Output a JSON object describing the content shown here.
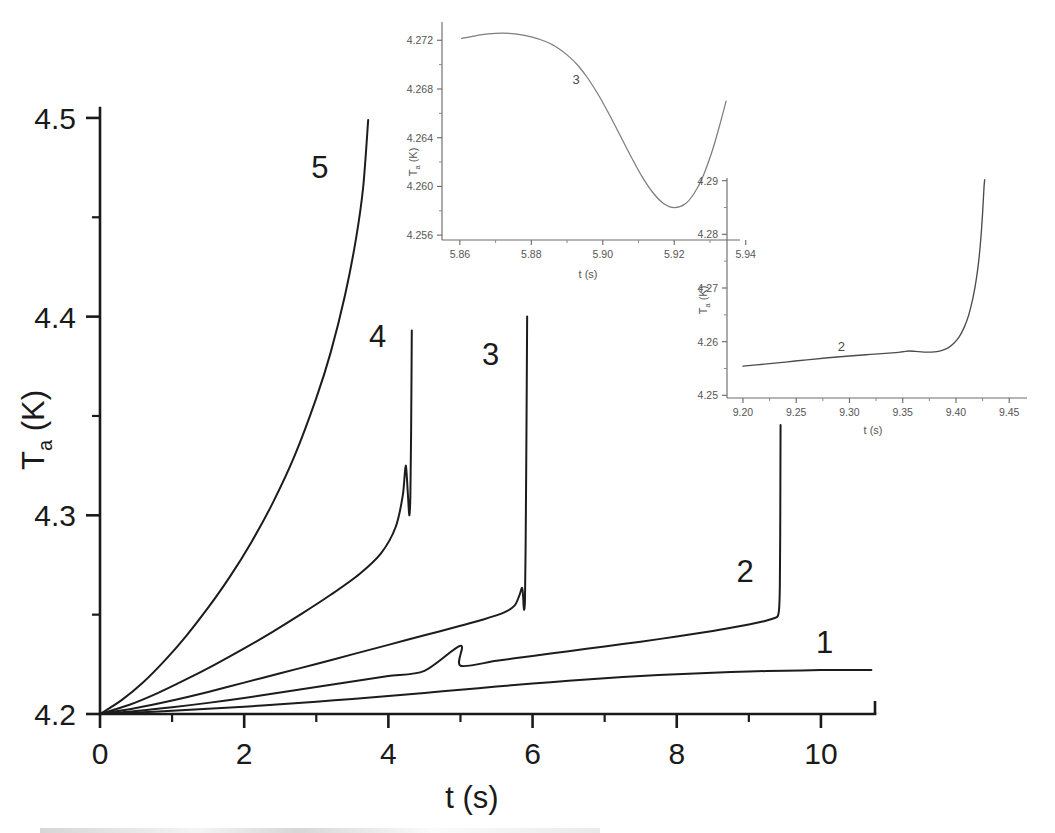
{
  "figure": {
    "background_color": "#ffffff",
    "line_color": "#1c1c1c",
    "inset_line_color": "#7d7d7d"
  },
  "chart_data": [
    {
      "id": "main-plot",
      "type": "line",
      "title": "",
      "xlabel": "t (s)",
      "ylabel": "T  (K)",
      "ylabel_base": "T",
      "ylabel_sub": "a",
      "ylabel_unit": "(K)",
      "xlim": [
        0,
        10.75
      ],
      "ylim": [
        4.2,
        4.505
      ],
      "xticks": [
        0,
        2,
        4,
        6,
        8,
        10
      ],
      "xticklabels": [
        "0",
        "2",
        "4",
        "6",
        "8",
        "10"
      ],
      "xminorticks": [
        1,
        3,
        5,
        7,
        9
      ],
      "yticks": [
        4.2,
        4.3,
        4.4,
        4.5
      ],
      "yticklabels": [
        "4.2",
        "4.3",
        "4.4",
        "4.5"
      ],
      "yminorticks": [
        4.25,
        4.35,
        4.45
      ],
      "grid": false,
      "legend_position": "inline-curve-labels",
      "series": [
        {
          "name": "1",
          "label": "1",
          "label_x": 10.05,
          "label_y": 4.2305,
          "points": [
            [
              0.0,
              4.2
            ],
            [
              0.5,
              4.2007
            ],
            [
              1.0,
              4.2016
            ],
            [
              1.5,
              4.2026
            ],
            [
              2.0,
              4.2037
            ],
            [
              2.5,
              4.2049
            ],
            [
              3.0,
              4.2062
            ],
            [
              3.5,
              4.2076
            ],
            [
              4.0,
              4.2091
            ],
            [
              4.5,
              4.2106
            ],
            [
              5.0,
              4.2122
            ],
            [
              5.5,
              4.2138
            ],
            [
              6.0,
              4.2153
            ],
            [
              6.5,
              4.2167
            ],
            [
              7.0,
              4.218
            ],
            [
              7.5,
              4.2191
            ],
            [
              8.0,
              4.22
            ],
            [
              8.5,
              4.2208
            ],
            [
              9.0,
              4.2214
            ],
            [
              9.5,
              4.2218
            ],
            [
              10.0,
              4.2221
            ],
            [
              10.4,
              4.2222
            ],
            [
              10.7,
              4.2222
            ]
          ]
        },
        {
          "name": "2",
          "label": "2",
          "label_x": 8.95,
          "label_y": 4.2665,
          "points": [
            [
              0.0,
              4.2
            ],
            [
              0.5,
              4.2015
            ],
            [
              1.0,
              4.2034
            ],
            [
              1.5,
              4.2056
            ],
            [
              2.0,
              4.2081
            ],
            [
              2.5,
              4.2108
            ],
            [
              3.0,
              4.2136
            ],
            [
              3.5,
              4.2164
            ],
            [
              4.0,
              4.2191
            ],
            [
              4.5,
              4.2217
            ],
            [
              5.0,
              4.2343
            ],
            [
              5.0,
              4.2243
            ],
            [
              5.5,
              4.2268
            ],
            [
              6.0,
              4.2292
            ],
            [
              6.5,
              4.2316
            ],
            [
              7.0,
              4.234
            ],
            [
              7.5,
              4.2364
            ],
            [
              8.0,
              4.239
            ],
            [
              8.5,
              4.2418
            ],
            [
              9.0,
              4.245
            ],
            [
              9.2,
              4.2466
            ],
            [
              9.35,
              4.2482
            ],
            [
              9.4,
              4.2492
            ],
            [
              9.42,
              4.253
            ],
            [
              9.43,
              4.264
            ],
            [
              9.435,
              4.29
            ],
            [
              9.44,
              4.3455
            ]
          ],
          "spike": {
            "t": 9.43,
            "peak": 4.3455
          }
        },
        {
          "name": "3",
          "label": "3",
          "label_x": 5.42,
          "label_y": 4.3755,
          "points": [
            [
              0.0,
              4.2
            ],
            [
              0.5,
              4.203
            ],
            [
              1.0,
              4.2068
            ],
            [
              1.5,
              4.2111
            ],
            [
              2.0,
              4.2158
            ],
            [
              2.5,
              4.2205
            ],
            [
              3.0,
              4.2252
            ],
            [
              3.5,
              4.23
            ],
            [
              4.0,
              4.2348
            ],
            [
              4.5,
              4.2396
            ],
            [
              5.0,
              4.2444
            ],
            [
              5.3,
              4.2474
            ],
            [
              5.6,
              4.251
            ],
            [
              5.75,
              4.2545
            ],
            [
              5.82,
              4.26
            ],
            [
              5.855,
              4.2635
            ],
            [
              5.87,
              4.2585
            ],
            [
              5.88,
              4.2525
            ],
            [
              5.895,
              4.258
            ],
            [
              5.905,
              4.29
            ],
            [
              5.915,
              4.34
            ],
            [
              5.925,
              4.4
            ]
          ],
          "spike": {
            "t": 5.92,
            "peak": 4.4
          }
        },
        {
          "name": "4",
          "label": "4",
          "label_x": 3.85,
          "label_y": 4.3845,
          "points": [
            [
              0.0,
              4.2
            ],
            [
              0.4,
              4.2045
            ],
            [
              0.8,
              4.2105
            ],
            [
              1.2,
              4.2175
            ],
            [
              1.6,
              4.225
            ],
            [
              2.0,
              4.233
            ],
            [
              2.4,
              4.2415
            ],
            [
              2.8,
              4.2505
            ],
            [
              3.2,
              4.26
            ],
            [
              3.6,
              4.2705
            ],
            [
              3.9,
              4.281
            ],
            [
              4.1,
              4.294
            ],
            [
              4.2,
              4.31
            ],
            [
              4.24,
              4.325
            ],
            [
              4.27,
              4.311
            ],
            [
              4.29,
              4.3
            ],
            [
              4.305,
              4.3095
            ],
            [
              4.315,
              4.34
            ],
            [
              4.325,
              4.393
            ]
          ],
          "spike": {
            "t": 4.3,
            "peak": 4.393
          }
        },
        {
          "name": "5",
          "label": "5",
          "label_x": 3.05,
          "label_y": 4.47,
          "points": [
            [
              0.0,
              4.2
            ],
            [
              0.3,
              4.207
            ],
            [
              0.6,
              4.216
            ],
            [
              0.9,
              4.227
            ],
            [
              1.2,
              4.2395
            ],
            [
              1.5,
              4.2535
            ],
            [
              1.8,
              4.269
            ],
            [
              2.1,
              4.2865
            ],
            [
              2.4,
              4.3065
            ],
            [
              2.7,
              4.33
            ],
            [
              3.0,
              4.359
            ],
            [
              3.2,
              4.382
            ],
            [
              3.4,
              4.411
            ],
            [
              3.55,
              4.439
            ],
            [
              3.65,
              4.465
            ],
            [
              3.72,
              4.499
            ]
          ]
        }
      ]
    },
    {
      "id": "inset-1",
      "type": "line",
      "title": "",
      "xlabel": "t (s)",
      "ylabel": "T  (K)",
      "ylabel_base": "T",
      "ylabel_sub": "a",
      "ylabel_unit": "(K)",
      "xlim": [
        5.855,
        5.937
      ],
      "ylim": [
        4.2556,
        4.2735
      ],
      "xticks": [
        5.86,
        5.88,
        5.9,
        5.92,
        5.94
      ],
      "xticklabels": [
        "5.86",
        "5.88",
        "5.90",
        "5.92",
        "5.94"
      ],
      "xminorticks": [
        5.87,
        5.89,
        5.91,
        5.93
      ],
      "yticks": [
        4.256,
        4.26,
        4.264,
        4.268,
        4.272
      ],
      "yticklabels": [
        "4.256",
        "4.260",
        "4.264",
        "4.268",
        "4.272"
      ],
      "yminorticks": [
        4.258,
        4.262,
        4.266,
        4.27
      ],
      "grid": false,
      "series": [
        {
          "name": "3",
          "label": "3",
          "label_x": 5.8925,
          "label_y": 4.2684,
          "points": [
            [
              5.8605,
              4.27215
            ],
            [
              5.864,
              4.27235
            ],
            [
              5.868,
              4.27252
            ],
            [
              5.872,
              4.27258
            ],
            [
              5.876,
              4.2725
            ],
            [
              5.88,
              4.27228
            ],
            [
              5.884,
              4.2719
            ],
            [
              5.887,
              4.27145
            ],
            [
              5.89,
              4.2708
            ],
            [
              5.893,
              4.26995
            ],
            [
              5.896,
              4.2688
            ],
            [
              5.899,
              4.2674
            ],
            [
              5.902,
              4.2658
            ],
            [
              5.905,
              4.2641
            ],
            [
              5.908,
              4.2624
            ],
            [
              5.911,
              4.2608
            ],
            [
              5.914,
              4.2595
            ],
            [
              5.917,
              4.2586
            ],
            [
              5.92,
              4.25825
            ],
            [
              5.923,
              4.25855
            ],
            [
              5.9255,
              4.2594
            ],
            [
              5.928,
              4.2608
            ],
            [
              5.9305,
              4.2628
            ],
            [
              5.9325,
              4.2648
            ],
            [
              5.9345,
              4.267
            ]
          ]
        }
      ]
    },
    {
      "id": "inset-2",
      "type": "line",
      "title": "",
      "xlabel": "t (s)",
      "ylabel": "T  (K)",
      "ylabel_base": "T",
      "ylabel_sub": "a",
      "ylabel_unit": "(K)",
      "xlim": [
        9.185,
        9.462
      ],
      "ylim": [
        4.2495,
        4.2905
      ],
      "xticks": [
        9.2,
        9.25,
        9.3,
        9.35,
        9.4,
        9.45
      ],
      "xticklabels": [
        "9.20",
        "9.25",
        "9.30",
        "9.35",
        "9.40",
        "9.45"
      ],
      "xminorticks": [
        9.225,
        9.275,
        9.325,
        9.375,
        9.425
      ],
      "yticks": [
        4.25,
        4.26,
        4.27,
        4.28,
        4.29
      ],
      "yticklabels": [
        "4.25",
        "4.26",
        "4.27",
        "4.28",
        "4.29"
      ],
      "yminorticks": [
        4.255,
        4.265,
        4.275,
        4.285
      ],
      "grid": false,
      "series": [
        {
          "name": "2",
          "label": "2",
          "label_x": 9.2925,
          "label_y": 4.2583,
          "points": [
            [
              9.2,
              4.25545
            ],
            [
              9.22,
              4.2558
            ],
            [
              9.24,
              4.2562
            ],
            [
              9.26,
              4.25662
            ],
            [
              9.28,
              4.257
            ],
            [
              9.3,
              4.25733
            ],
            [
              9.32,
              4.25762
            ],
            [
              9.34,
              4.2579
            ],
            [
              9.35,
              4.25812
            ],
            [
              9.356,
              4.25826
            ],
            [
              9.362,
              4.25818
            ],
            [
              9.37,
              4.25805
            ],
            [
              9.38,
              4.2581
            ],
            [
              9.387,
              4.25838
            ],
            [
              9.393,
              4.2589
            ],
            [
              9.398,
              4.2597
            ],
            [
              9.403,
              4.2609
            ],
            [
              9.408,
              4.2628
            ],
            [
              9.412,
              4.265
            ],
            [
              9.416,
              4.2682
            ],
            [
              9.419,
              4.2715
            ],
            [
              9.4215,
              4.2753
            ],
            [
              9.4235,
              4.2796
            ],
            [
              9.425,
              4.284
            ],
            [
              9.4263,
              4.2887
            ],
            [
              9.427,
              4.2902
            ]
          ]
        }
      ]
    }
  ]
}
